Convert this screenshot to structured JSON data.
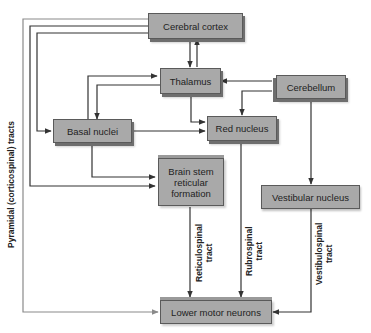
{
  "diagram": {
    "type": "flowchart",
    "colors": {
      "box_fill": "#a9a9a9",
      "box_border": "#5a5a5a",
      "line": "#333333",
      "pyramidal_line": "#8a8a8a"
    },
    "nodes": {
      "cerebral_cortex": "Cerebral cortex",
      "thalamus": "Thalamus",
      "cerebellum": "Cerebellum",
      "basal_nuclei": "Basal nuclei",
      "red_nucleus": "Red nucleus",
      "brain_stem_line1": "Brain stem",
      "brain_stem_line2": "reticular",
      "brain_stem_line3": "formation",
      "vestibular_nucleus": "Vestibular nucleus",
      "lower_motor_neurons": "Lower motor neurons"
    },
    "labels": {
      "pyramidal": "Pyramidal (corticospinal) tracts",
      "reticulospinal_line1": "Reticulospinal",
      "reticulospinal_line2": "tract",
      "rubrospinal_line1": "Rubrospinal",
      "rubrospinal_line2": "tract",
      "vestibulospinal_line1": "Vestibulospinal",
      "vestibulospinal_line2": "tract"
    },
    "edges": [
      {
        "from": "Cerebral cortex",
        "to": "Thalamus"
      },
      {
        "from": "Thalamus",
        "to": "Cerebral cortex"
      },
      {
        "from": "Cerebral cortex",
        "to": "Basal nuclei"
      },
      {
        "from": "Cerebral cortex",
        "to": "Brain stem reticular formation"
      },
      {
        "from": "Cerebral cortex",
        "to": "Lower motor neurons",
        "label": "Pyramidal (corticospinal) tracts"
      },
      {
        "from": "Basal nuclei",
        "to": "Thalamus"
      },
      {
        "from": "Thalamus",
        "to": "Basal nuclei"
      },
      {
        "from": "Basal nuclei",
        "to": "Red nucleus"
      },
      {
        "from": "Basal nuclei",
        "to": "Brain stem reticular formation"
      },
      {
        "from": "Thalamus",
        "to": "Red nucleus"
      },
      {
        "from": "Cerebellum",
        "to": "Thalamus"
      },
      {
        "from": "Cerebellum",
        "to": "Red nucleus"
      },
      {
        "from": "Cerebellum",
        "to": "Vestibular nucleus"
      },
      {
        "from": "Brain stem reticular formation",
        "to": "Lower motor neurons",
        "label": "Reticulospinal tract"
      },
      {
        "from": "Red nucleus",
        "to": "Lower motor neurons",
        "label": "Rubrospinal tract"
      },
      {
        "from": "Vestibular nucleus",
        "to": "Lower motor neurons",
        "label": "Vestibulospinal tract"
      }
    ]
  }
}
